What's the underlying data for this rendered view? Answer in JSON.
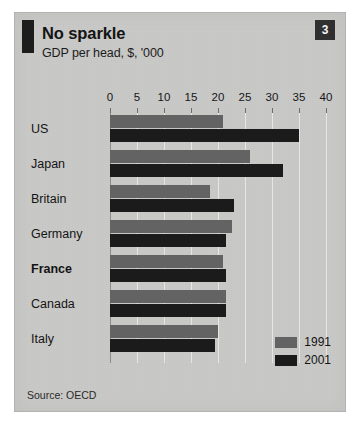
{
  "card": {
    "title": "No sparkle",
    "subtitle": "GDP per head, $, '000",
    "badge": "3",
    "source": "Source: OECD"
  },
  "legend": {
    "position": "bottom-right",
    "items": [
      {
        "label": "1991",
        "color": "#636363",
        "swatch": "legend-swatch-1991"
      },
      {
        "label": "2001",
        "color": "#1b1b1b",
        "swatch": "legend-swatch-2001"
      }
    ]
  },
  "colors": {
    "paper": "#c9c9c7",
    "series_1991": "#636363",
    "series_2001": "#1b1b1b",
    "gridline": "#e6e6e4",
    "axis": "#8d8d8b",
    "badge_bg": "#303030",
    "tab_mark": "#1d1d1d"
  },
  "chart_data": {
    "type": "bar",
    "orientation": "horizontal",
    "title": "No sparkle",
    "subtitle": "GDP per head, $, '000",
    "xlabel": "",
    "ylabel": "",
    "xlim": [
      0,
      40
    ],
    "xticks": [
      0,
      5,
      10,
      15,
      20,
      25,
      30,
      35,
      40
    ],
    "xtick_labels": [
      "0",
      "5",
      "10",
      "15",
      "20",
      "25",
      "30",
      "35",
      "40"
    ],
    "grid": true,
    "legend_position": "bottom-right",
    "source": "Source: OECD",
    "categories": [
      "US",
      "Japan",
      "Britain",
      "Germany",
      "France",
      "Canada",
      "Italy"
    ],
    "emphasized_category": "France",
    "series": [
      {
        "name": "1991",
        "color": "#636363",
        "values": [
          21.0,
          26.0,
          18.5,
          22.5,
          21.0,
          21.5,
          20.0
        ]
      },
      {
        "name": "2001",
        "color": "#1b1b1b",
        "values": [
          35.0,
          32.0,
          23.0,
          21.5,
          21.5,
          21.5,
          19.5
        ]
      }
    ]
  }
}
